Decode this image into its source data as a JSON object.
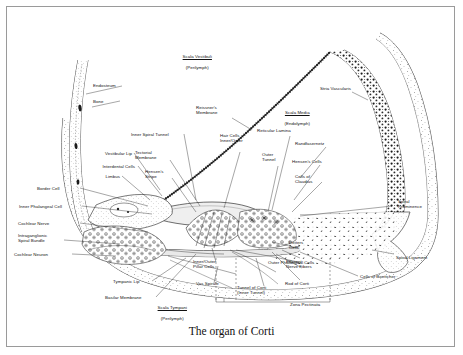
{
  "figure": {
    "title": "The organ of Corti",
    "border_color": "#9a9a9a",
    "background": "#ffffff",
    "ink_color": "#111111"
  },
  "compartments": [
    {
      "id": "scala-vestibuli",
      "name": "Scala Vestibuli",
      "sub": "(Perilymph)",
      "underlined": true,
      "x": 196,
      "y": 49
    },
    {
      "id": "scala-media",
      "name": "Scala Media",
      "sub": "(Endolymph)",
      "underlined": true,
      "x": 296,
      "y": 105
    },
    {
      "id": "scala-tympani",
      "name": "Scala Tympani",
      "sub": "(Perilymph)",
      "underlined": true,
      "x": 171,
      "y": 300
    }
  ],
  "labels_left": [
    {
      "id": "endosteum",
      "text": "Endosteum",
      "x": 93,
      "y": 85
    },
    {
      "id": "bone",
      "text": "Bone",
      "x": 93,
      "y": 101
    },
    {
      "id": "vestibular-lip",
      "text": "Vestibular Lip",
      "x": 86,
      "y": 153
    },
    {
      "id": "interdental-cells",
      "text": "Interdental Cells",
      "x": 79,
      "y": 166
    },
    {
      "id": "limbus",
      "text": "Limbus",
      "x": 96,
      "y": 176
    },
    {
      "id": "border-cell",
      "text": "Border Cell",
      "x": 37,
      "y": 188
    },
    {
      "id": "inner-phalangeal-cell",
      "text": "Inner Phalangeal Cell",
      "x": 19,
      "y": 206
    },
    {
      "id": "cochlear-nerve",
      "text": "Cochlear Nerve",
      "x": 18,
      "y": 223
    },
    {
      "id": "intraganglionic-spiral-bundle",
      "text": "Intraganglionic\nSpiral Bundle",
      "x": 18,
      "y": 234
    },
    {
      "id": "cochlear-neuron",
      "text": "Cochlear Neuron",
      "x": 14,
      "y": 254
    }
  ],
  "labels_center": [
    {
      "id": "inner-spiral-tunnel",
      "text": "Inner Spiral Tunnel",
      "x": 131,
      "y": 134
    },
    {
      "id": "reissners-membrane",
      "text": "Reissner's\nMembrane",
      "x": 196,
      "y": 110
    },
    {
      "id": "tectorial-membrane",
      "text": "Tectorial\nMembrane",
      "x": 141,
      "y": 154
    },
    {
      "id": "hensens-stripe",
      "text": "Hensen's\nStripe",
      "x": 150,
      "y": 173
    },
    {
      "id": "hair-cells-inner-outer",
      "text": "Hair Cells\nInner/Outer",
      "x": 222,
      "y": 140
    },
    {
      "id": "reticular-lamina",
      "text": "Reticular Lamina",
      "x": 259,
      "y": 130
    },
    {
      "id": "outer-tunnel",
      "text": "Outer\nTunnel",
      "x": 264,
      "y": 155
    },
    {
      "id": "randfasernetz",
      "text": "Randfasernetz",
      "x": 295,
      "y": 143
    },
    {
      "id": "hensens-cells",
      "text": "Hensen's Cells",
      "x": 292,
      "y": 161
    },
    {
      "id": "cells-of-claudius",
      "text": "Cells of\nClaudius",
      "x": 295,
      "y": 176
    }
  ],
  "labels_right": [
    {
      "id": "stria-vascularis",
      "text": "Stria Vascularis",
      "x": 305,
      "y": 88
    },
    {
      "id": "spiral-prominence",
      "text": "Spiral\nProminence",
      "x": 419,
      "y": 201
    },
    {
      "id": "spiral-ligament",
      "text": "Spiral Ligament",
      "x": 396,
      "y": 257
    },
    {
      "id": "cells-of-boettcher",
      "text": "Cells of Boettcher",
      "x": 360,
      "y": 276
    }
  ],
  "labels_bottom": [
    {
      "id": "tympanic-lip",
      "text": "Tympanic Lip",
      "x": 113,
      "y": 281
    },
    {
      "id": "basilar-membrane",
      "text": "Basilar Membrane",
      "x": 105,
      "y": 297
    },
    {
      "id": "inner-outer-pillar-cells",
      "text": "Inner/Outer\nPillar Cells",
      "x": 196,
      "y": 263
    },
    {
      "id": "vas-spirale",
      "text": "Vas Spirale",
      "x": 196,
      "y": 283
    },
    {
      "id": "tunnel-of-corti",
      "text": "Tunnel of Corti\n(Inner Tunnel)",
      "x": 237,
      "y": 289
    },
    {
      "id": "rod-of-corti",
      "text": "Rod of Corti",
      "x": 285,
      "y": 283
    },
    {
      "id": "efferent-nerve-fibers",
      "text": "Efferent\nNerve Fibers",
      "x": 286,
      "y": 263
    },
    {
      "id": "deiters-cells",
      "text": "Deiters\nCells",
      "x": 289,
      "y": 244
    },
    {
      "id": "outer-phalangeal-cells",
      "text": "Outer Phalangeal Cells",
      "x": 268,
      "y": 262
    },
    {
      "id": "zona-pectinata",
      "text": "Zona Pectinata",
      "x": 290,
      "y": 304
    }
  ]
}
